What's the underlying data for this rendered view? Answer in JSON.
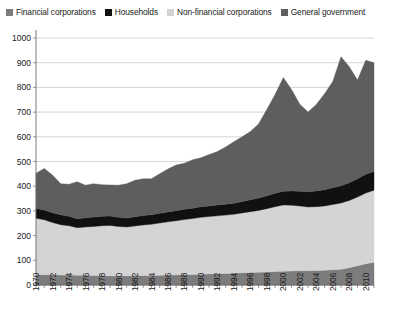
{
  "legend": {
    "position": "top",
    "items": [
      {
        "label": "Financial corporations",
        "color": "#7c7c7c",
        "icon": "square-swatch-icon"
      },
      {
        "label": "Households",
        "color": "#111111",
        "icon": "square-swatch-icon"
      },
      {
        "label": "Non-financial corporations",
        "color": "#d4d4d4",
        "icon": "square-swatch-icon"
      },
      {
        "label": "General government",
        "color": "#5e5e5e",
        "icon": "square-swatch-icon"
      }
    ]
  },
  "axes": {
    "y_ticks": [
      "1000",
      "900",
      "800",
      "700",
      "600",
      "500",
      "400",
      "300",
      "200",
      "100",
      "0"
    ],
    "x_ticks": [
      "1970",
      "1972",
      "1974",
      "1976",
      "1978",
      "1980",
      "1982",
      "1984",
      "1986",
      "1988",
      "1990",
      "1992",
      "1994",
      "1996",
      "1998",
      "2000",
      "2002",
      "2004",
      "2006",
      "2008",
      "2010"
    ]
  },
  "chart_data": {
    "type": "area",
    "stacked": true,
    "title": "",
    "subtitle": "",
    "xlabel": "",
    "ylabel": "",
    "xlim": [
      1970,
      2011
    ],
    "ylim": [
      0,
      1000
    ],
    "y_tick_step": 100,
    "x_tick_step": 2,
    "grid": true,
    "legend_position": "top",
    "x": [
      1970,
      1971,
      1972,
      1973,
      1974,
      1975,
      1976,
      1977,
      1978,
      1979,
      1980,
      1981,
      1982,
      1983,
      1984,
      1985,
      1986,
      1987,
      1988,
      1989,
      1990,
      1991,
      1992,
      1993,
      1994,
      1995,
      1996,
      1997,
      1998,
      1999,
      2000,
      2001,
      2002,
      2003,
      2004,
      2005,
      2006,
      2007,
      2008,
      2009,
      2010,
      2011
    ],
    "series": [
      {
        "name": "Financial corporations",
        "color": "#7c7c7c",
        "stack_order": 1,
        "values": [
          42,
          42,
          41,
          40,
          40,
          39,
          39,
          38,
          38,
          37,
          37,
          37,
          38,
          38,
          38,
          39,
          40,
          41,
          42,
          43,
          44,
          45,
          46,
          47,
          48,
          50,
          51,
          52,
          53,
          55,
          56,
          57,
          58,
          58,
          59,
          60,
          62,
          64,
          70,
          78,
          86,
          92
        ]
      },
      {
        "name": "Non-financial corporations",
        "color": "#d4d4d4",
        "stack_order": 2,
        "values": [
          228,
          222,
          212,
          204,
          200,
          193,
          196,
          199,
          202,
          204,
          200,
          198,
          201,
          205,
          208,
          212,
          216,
          219,
          223,
          226,
          230,
          232,
          234,
          236,
          238,
          242,
          246,
          250,
          256,
          262,
          268,
          266,
          262,
          258,
          258,
          260,
          264,
          268,
          272,
          278,
          286,
          292
        ]
      },
      {
        "name": "Households",
        "color": "#111111",
        "stack_order": 3,
        "values": [
          40,
          40,
          40,
          40,
          38,
          36,
          37,
          38,
          38,
          38,
          37,
          36,
          37,
          38,
          38,
          39,
          40,
          41,
          42,
          42,
          43,
          43,
          44,
          44,
          45,
          46,
          48,
          50,
          52,
          54,
          56,
          58,
          60,
          62,
          64,
          66,
          68,
          70,
          72,
          74,
          76,
          76
        ]
      },
      {
        "name": "General government",
        "color": "#5e5e5e",
        "stack_order": 4,
        "values": [
          142,
          168,
          152,
          126,
          130,
          150,
          132,
          135,
          128,
          126,
          130,
          139,
          148,
          149,
          146,
          160,
          174,
          185,
          186,
          196,
          198,
          208,
          216,
          232,
          249,
          262,
          276,
          300,
          350,
          400,
          460,
          410,
          352,
          322,
          350,
          388,
          430,
          522,
          470,
          400,
          462,
          440
        ]
      }
    ],
    "totals": [
      452,
      472,
      445,
      410,
      408,
      418,
      404,
      410,
      406,
      405,
      404,
      410,
      424,
      430,
      430,
      450,
      470,
      486,
      493,
      507,
      515,
      528,
      540,
      559,
      580,
      600,
      621,
      652,
      711,
      771,
      840,
      791,
      732,
      700,
      731,
      774,
      824,
      924,
      884,
      830,
      910,
      900
    ]
  }
}
